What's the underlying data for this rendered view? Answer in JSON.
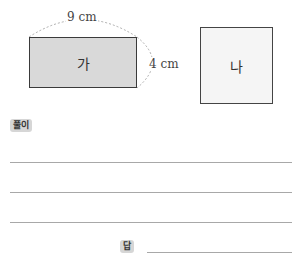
{
  "figure": {
    "shape_a": {
      "label": "가",
      "width_label": "9 cm",
      "height_label": "4 cm",
      "fill": "#d9d9d9"
    },
    "shape_b": {
      "label": "나",
      "fill": "#f5f5f5"
    }
  },
  "solution": {
    "badge_label": "풀이",
    "lines": 3
  },
  "answer": {
    "badge_label": "답",
    "value": ""
  }
}
